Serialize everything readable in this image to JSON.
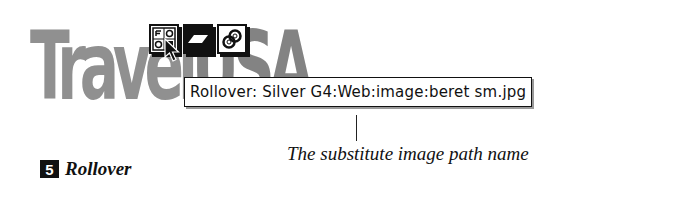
{
  "logo": {
    "part1": "Travel",
    "part2": "USA"
  },
  "toolbar": {
    "buttons": [
      {
        "icon": "rollover-icon",
        "label": "Rollover"
      },
      {
        "icon": "shape-icon",
        "label": "Shape"
      },
      {
        "icon": "link-icon",
        "label": "Link"
      }
    ]
  },
  "tooltip": {
    "text": "Rollover: Silver G4:Web:image:beret sm.jpg"
  },
  "caption": {
    "text": "The substitute image path name"
  },
  "step": {
    "number": "5",
    "label": "Rollover"
  },
  "colors": {
    "ink": "#111111",
    "logo": "#7d7d7d",
    "background": "#ffffff"
  }
}
